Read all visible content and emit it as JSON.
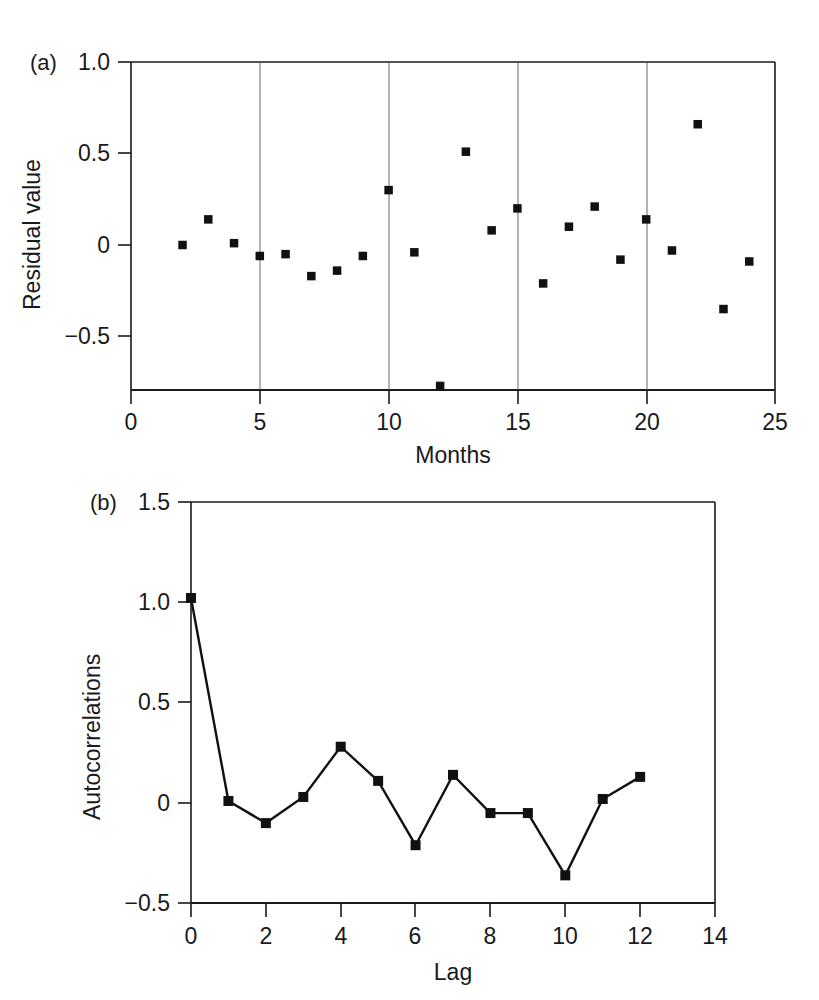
{
  "figure": {
    "background": "#ffffff",
    "ink_color": "#1a1a1a",
    "marker_color": "#111111"
  },
  "panel_a": {
    "label": "(a)",
    "ylabel": "Residual value",
    "xlabel": "Months",
    "ytick_labels": [
      "1.0",
      "0.5",
      "0",
      "−0.5"
    ],
    "xtick_labels": [
      "0",
      "5",
      "10",
      "15",
      "20",
      "25"
    ]
  },
  "panel_b": {
    "label": "(b)",
    "ylabel": "Autocorrelations",
    "xlabel": "Lag",
    "ytick_labels": [
      "1.5",
      "1.0",
      "0.5",
      "0",
      "−0.5"
    ],
    "xtick_labels": [
      "0",
      "2",
      "4",
      "6",
      "8",
      "10",
      "12",
      "14"
    ]
  },
  "chart_data": [
    {
      "type": "scatter",
      "title": "(a)",
      "xlabel": "Months",
      "ylabel": "Residual value",
      "xlim": [
        0,
        25
      ],
      "ylim": [
        -0.82,
        1.0
      ],
      "xticks": [
        0,
        5,
        10,
        15,
        20,
        25
      ],
      "yticks": [
        -0.5,
        0,
        0.5,
        1.0
      ],
      "grid": "vertical gridlines at x = 5, 10, 15, 20",
      "legend": "none",
      "marker": "filled square",
      "x": [
        2,
        3,
        4,
        5,
        6,
        7,
        8,
        9,
        10,
        11,
        12,
        13,
        14,
        15,
        16,
        17,
        18,
        19,
        20,
        21,
        22,
        23,
        24
      ],
      "values": [
        0.0,
        0.14,
        0.01,
        -0.06,
        -0.05,
        -0.17,
        -0.14,
        -0.06,
        0.3,
        -0.04,
        -0.77,
        0.51,
        0.08,
        0.2,
        -0.21,
        0.1,
        0.21,
        -0.08,
        0.14,
        -0.03,
        0.66,
        -0.35,
        -0.09
      ]
    },
    {
      "type": "line",
      "title": "(b)",
      "xlabel": "Lag",
      "ylabel": "Autocorrelations",
      "xlim": [
        0,
        14
      ],
      "ylim": [
        -0.5,
        1.5
      ],
      "xticks": [
        0,
        2,
        4,
        6,
        8,
        10,
        12,
        14
      ],
      "yticks": [
        -0.5,
        0,
        0.5,
        1.0,
        1.5
      ],
      "grid": "off",
      "legend": "none",
      "marker": "filled square",
      "x": [
        0,
        1,
        2,
        3,
        4,
        5,
        6,
        7,
        8,
        9,
        10,
        11,
        12
      ],
      "values": [
        1.02,
        0.01,
        -0.1,
        0.03,
        0.28,
        0.11,
        -0.21,
        0.14,
        -0.05,
        -0.05,
        -0.36,
        0.02,
        0.13
      ]
    }
  ]
}
